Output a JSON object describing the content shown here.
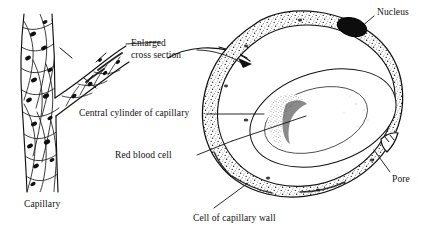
{
  "figure": {
    "background_color": "#ffffff",
    "ink_color": "#111111",
    "width": 432,
    "height": 237
  },
  "labels": {
    "enlarged_cross_section": "Enlarged\ncross section",
    "enlarged_line1": "Enlarged",
    "enlarged_line2": "cross section",
    "central_cylinder": "Central cylinder of capillary",
    "red_blood_cell": "Red blood cell",
    "cell_of_capillary_wall": "Cell of capillary wall",
    "nucleus": "Nucleus",
    "pore": "Pore",
    "capillary": "Capillary"
  },
  "parts": {
    "capillary_tube": "capillary-tube",
    "capillary_branch": "capillary-branch",
    "endothelial_cells": "endothelial-cell-mosaic",
    "section_plane_marks": "section-plane-tick-marks",
    "cross_section_wall": "capillary-wall-ring",
    "lumen": "central-cylinder-lumen",
    "red_blood_cell_body": "red-blood-cell",
    "wall_nucleus": "wall-cell-nucleus",
    "wall_pore": "wall-pore",
    "pointer_arrow": "enlargement-arrow"
  },
  "leader_lines": {
    "enlarged": "curved arrow from label to cross section",
    "central_cylinder": "horizontal line to lumen",
    "red_blood_cell": "line to red blood cell",
    "cell_of_capillary_wall": "diagonal line up to wall",
    "nucleus": "short line down-left to dark nucleus",
    "pore": "diagonal line up-left to pore notch"
  }
}
